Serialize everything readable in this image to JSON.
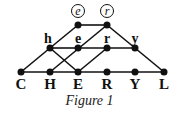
{
  "figure": {
    "caption": "Figure 1",
    "top_labels": [
      {
        "text": "e",
        "x": 78,
        "y": 12
      },
      {
        "text": "r",
        "x": 107,
        "y": 12
      }
    ],
    "middle_labels": [
      {
        "text": "h",
        "x": 50,
        "y": 42
      },
      {
        "text": "e",
        "x": 78,
        "y": 42
      },
      {
        "text": "r",
        "x": 107,
        "y": 42
      },
      {
        "text": "y",
        "x": 135,
        "y": 42
      }
    ],
    "bottom_labels": [
      {
        "text": "C",
        "x": 21
      },
      {
        "text": "H",
        "x": 50
      },
      {
        "text": "E",
        "x": 78
      },
      {
        "text": "R",
        "x": 107
      },
      {
        "text": "Y",
        "x": 135
      },
      {
        "text": "L",
        "x": 164
      }
    ]
  }
}
